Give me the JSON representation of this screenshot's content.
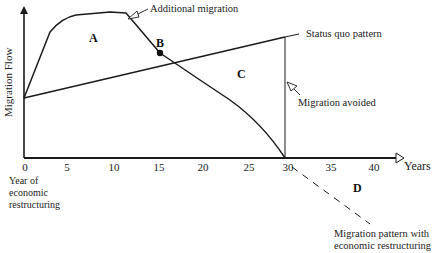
{
  "diagram": {
    "y_axis_label": "Migration Flow",
    "x_axis_label": "Years",
    "x_ticks": [
      "0",
      "5",
      "10",
      "15",
      "20",
      "25",
      "30",
      "35",
      "40"
    ],
    "x_origin_note": [
      "Year of",
      "economic",
      "restructuring"
    ],
    "regions": {
      "a": "A",
      "b": "B",
      "c": "C",
      "d": "D"
    },
    "annotations": {
      "additional_migration": "Additional migration",
      "status_quo": "Status quo pattern",
      "migration_avoided": "Migration avoided",
      "restructuring_pattern_line1": "Migration pattern with",
      "restructuring_pattern_line2": "economic restructuring"
    },
    "colors": {
      "line": "#1a1a1a",
      "background": "#ffffff"
    }
  }
}
